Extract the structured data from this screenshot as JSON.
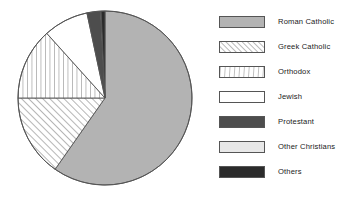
{
  "chart_data": {
    "type": "pie",
    "title": "",
    "subtitle": "",
    "xlabel": "",
    "ylabel": "",
    "grid": false,
    "legend_position": "right",
    "start_angle_deg": 0,
    "direction": "counterclockwise",
    "center": {
      "x": 105,
      "y": 98
    },
    "radius": 87,
    "categories": [
      "Roman Catholic",
      "Greek Catholic",
      "Orthodox",
      "Jewish",
      "Protestant",
      "Other Christians",
      "Others"
    ],
    "values": [
      59.7,
      15.3,
      13.3,
      8.3,
      2.5,
      0.1,
      0.8
    ],
    "slices": [
      {
        "label": "Roman Catholic",
        "value": 59.7,
        "fill": "#b3b3b3",
        "pattern": "solid",
        "start_deg": 0,
        "end_deg": 215
      },
      {
        "label": "Greek Catholic",
        "value": 15.3,
        "fill": "#ffffff",
        "pattern": "diagonal-hatch",
        "start_deg": 215,
        "end_deg": 270
      },
      {
        "label": "Orthodox",
        "value": 13.3,
        "fill": "#ffffff",
        "pattern": "vertical-hatch",
        "start_deg": 270,
        "end_deg": 318
      },
      {
        "label": "Jewish",
        "value": 8.3,
        "fill": "#ffffff",
        "pattern": "solid",
        "start_deg": 318,
        "end_deg": 348
      },
      {
        "label": "Protestant",
        "value": 2.5,
        "fill": "#4d4d4d",
        "pattern": "solid",
        "start_deg": 348,
        "end_deg": 357
      },
      {
        "label": "Other Christians",
        "value": 0.1,
        "fill": "#e8e8e8",
        "pattern": "solid",
        "start_deg": 357,
        "end_deg": 357.4
      },
      {
        "label": "Others",
        "value": 0.8,
        "fill": "#2b2b2b",
        "pattern": "solid",
        "start_deg": 357.4,
        "end_deg": 360
      }
    ],
    "colors": {
      "roman_catholic": "#b3b3b3",
      "greek_catholic": "#ffffff",
      "orthodox": "#ffffff",
      "jewish": "#ffffff",
      "protestant": "#4d4d4d",
      "other_christians": "#e8e8e8",
      "others": "#2b2b2b",
      "outline": "#555555",
      "background": "#ffffff",
      "text": "#1a1a1a"
    }
  },
  "legend": {
    "items": [
      {
        "label": "Roman Catholic",
        "swatch": "solid-gray",
        "y": 5
      },
      {
        "label": "Greek Catholic",
        "swatch": "diagonal-hatch",
        "y": 30
      },
      {
        "label": "Orthodox",
        "swatch": "vertical-hatch",
        "y": 55
      },
      {
        "label": "Jewish",
        "swatch": "solid-white",
        "y": 80
      },
      {
        "label": "Protestant",
        "swatch": "solid-dark-gray",
        "y": 105
      },
      {
        "label": "Other Christians",
        "swatch": "solid-light-gray",
        "y": 130
      },
      {
        "label": "Others",
        "swatch": "solid-near-black",
        "y": 155
      }
    ]
  }
}
